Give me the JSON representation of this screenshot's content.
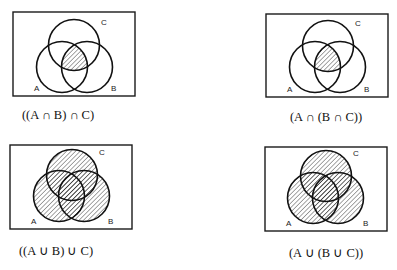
{
  "colors": {
    "ink": "#111111",
    "background": "#ffffff"
  },
  "diagrams": [
    {
      "id": "intersect-left",
      "caption": "((A ∩ B) ∩ C)",
      "shading": "intersection",
      "labels": {
        "A": "A",
        "B": "B",
        "C": "C"
      }
    },
    {
      "id": "intersect-right",
      "caption": "(A ∩ (B ∩ C))",
      "shading": "intersection",
      "labels": {
        "A": "A",
        "B": "B",
        "C": "C"
      }
    },
    {
      "id": "union-left",
      "caption": "((A ∪ B) ∪ C)",
      "shading": "union",
      "labels": {
        "A": "A",
        "B": "B",
        "C": "C"
      }
    },
    {
      "id": "union-right",
      "caption": "(A ∪ (B ∪ C))",
      "shading": "union",
      "labels": {
        "A": "A",
        "B": "B",
        "C": "C"
      }
    }
  ]
}
